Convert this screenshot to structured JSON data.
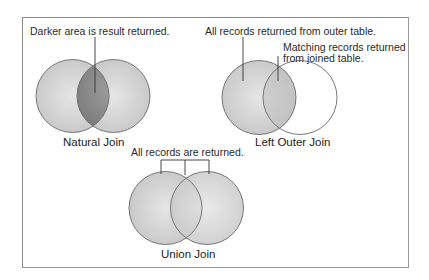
{
  "diagram": {
    "natural_join": {
      "annotation": "Darker area is result returned.",
      "title": "Natural Join"
    },
    "left_outer_join": {
      "annotation_outer": "All records returned from outer table.",
      "annotation_joined_line1": "Matching records returned",
      "annotation_joined_line2": "from joined table.",
      "title": "Left Outer Join"
    },
    "union_join": {
      "annotation": "All records are returned.",
      "title": "Union Join"
    },
    "colors": {
      "circle_fill": "#d2d2d2",
      "intersection_dark": "#8e8e8e",
      "outline": "#6a6a6a",
      "frame": "#8a8a8a"
    }
  }
}
